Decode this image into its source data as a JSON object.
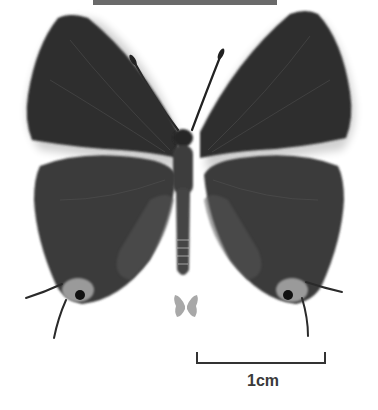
{
  "image": {
    "subject": "butterfly specimen, dorsal view",
    "background": "#ffffff",
    "wing_color": "#2e2e2e",
    "tornal_spot_color": "#9a9a9a",
    "top_bar_color": "#6a6a6a"
  },
  "sex_icon": {
    "name": "butterfly-icon",
    "color": "#a8a8a8"
  },
  "scale_bar": {
    "label": "1cm",
    "color": "#333333"
  }
}
